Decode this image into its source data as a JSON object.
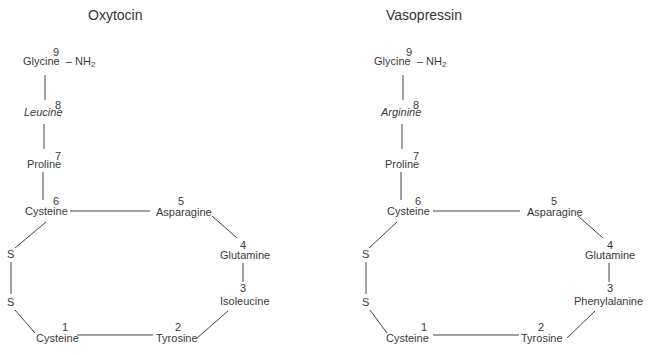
{
  "diagrams": [
    {
      "title": "Oxytocin",
      "residues": [
        {
          "pos": "1",
          "name": "Cysteine"
        },
        {
          "pos": "2",
          "name": "Tyrosine"
        },
        {
          "pos": "3",
          "name": "Isoleucine"
        },
        {
          "pos": "4",
          "name": "Glutamine"
        },
        {
          "pos": "5",
          "name": "Asparagine"
        },
        {
          "pos": "6",
          "name": "Cysteine"
        },
        {
          "pos": "7",
          "name": "Proline"
        },
        {
          "pos": "8",
          "name": "Leucine"
        },
        {
          "pos": "9",
          "name": "Glycine"
        }
      ],
      "terminal": "– NH",
      "terminal_sub": "2",
      "sulfur": [
        "S",
        "S"
      ]
    },
    {
      "title": "Vasopressin",
      "residues": [
        {
          "pos": "1",
          "name": "Cysteine"
        },
        {
          "pos": "2",
          "name": "Tyrosine"
        },
        {
          "pos": "3",
          "name": "Phenylalanine"
        },
        {
          "pos": "4",
          "name": "Glutamine"
        },
        {
          "pos": "5",
          "name": "Asparagine"
        },
        {
          "pos": "6",
          "name": "Cysteine"
        },
        {
          "pos": "7",
          "name": "Proline"
        },
        {
          "pos": "8",
          "name": "Arginine"
        },
        {
          "pos": "9",
          "name": "Glycine"
        }
      ],
      "terminal": "– NH",
      "terminal_sub": "2",
      "sulfur": [
        "S",
        "S"
      ]
    }
  ],
  "colors": {
    "text": "#3a3a3a",
    "line": "#444444",
    "background": "#ffffff"
  }
}
